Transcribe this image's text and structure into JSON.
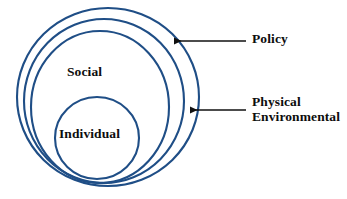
{
  "diagram": {
    "type": "concentric-circles-ecological-model",
    "colors": {
      "ring_stroke": "#1f4e86",
      "ring_stroke_dark": "#1b3f6e",
      "label_text": "#0d0d0d",
      "leader_line": "#101010",
      "background": "#ffffff"
    },
    "rings": [
      {
        "id": "policy",
        "label": "Policy",
        "label_placement": "external-callout",
        "order": 1,
        "cx": 108,
        "cy": 97,
        "rx": 91,
        "ry": 89
      },
      {
        "id": "physical-environmental",
        "label": "Physical Environmental",
        "label_placement": "external-callout",
        "order": 2,
        "cx": 104,
        "cy": 101,
        "rx": 80,
        "ry": 82
      },
      {
        "id": "social",
        "label": "Social",
        "label_placement": "internal",
        "order": 3,
        "cx": 100,
        "cy": 107,
        "rx": 69,
        "ry": 76
      },
      {
        "id": "individual",
        "label": "Individual",
        "label_placement": "internal",
        "order": 4,
        "cx": 97,
        "cy": 138,
        "rx": 42,
        "ry": 41
      }
    ],
    "internal_labels": {
      "social": "Social",
      "individual": "Individual"
    },
    "callouts": [
      {
        "id": "policy",
        "label": "Policy",
        "lines": [
          "Policy"
        ],
        "arrow_direction": "left",
        "arrow_tip_x": 174,
        "arrow_tip_y": 41,
        "leader_end_x": 246,
        "leader_y": 41
      },
      {
        "id": "physical-environmental",
        "label": "Physical Environmental",
        "lines": [
          "Physical",
          "Environmental"
        ],
        "arrow_direction": "left",
        "arrow_tip_x": 190,
        "arrow_tip_y": 110,
        "leader_end_x": 246,
        "leader_y": 110
      }
    ]
  }
}
